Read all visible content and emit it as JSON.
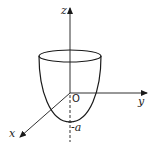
{
  "figure": {
    "type": "3d-paraboloid-diagram",
    "axes": {
      "z_label": "z",
      "y_label": "y",
      "x_label": "x",
      "origin_label": "O"
    },
    "annotations": {
      "vertex_label": "-a"
    },
    "colors": {
      "stroke": "#1a1a1a",
      "background": "#ffffff"
    }
  }
}
